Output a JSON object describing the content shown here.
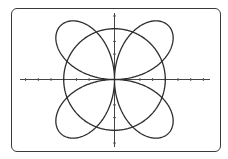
{
  "chart_data": {
    "type": "line",
    "title": "",
    "xlabel": "",
    "ylabel": "",
    "series": [
      {
        "name": "rose",
        "equation": "r = 6 sin(2θ)",
        "polar": true,
        "a": 6,
        "k": 2,
        "theta_range": [
          0,
          6.283185307
        ],
        "color": "#2e2e2e"
      },
      {
        "name": "circle",
        "equation": "r = 4",
        "polar": true,
        "r": 4,
        "theta_range": [
          0,
          6.283185307
        ],
        "color": "#2e2e2e"
      }
    ],
    "xlim": [
      -7.2,
      7.5
    ],
    "ylim": [
      -5.3,
      5.2
    ],
    "x_ticks": [
      -7,
      -6,
      -5,
      -4,
      -3,
      -2,
      -1,
      1,
      2,
      3,
      4,
      5,
      6,
      7
    ],
    "y_ticks": [
      -5,
      -4,
      -3,
      -2,
      -1,
      1,
      2,
      3,
      4,
      5
    ],
    "grid": false,
    "legend": null
  },
  "layout": {
    "origin_px": [
      114.5,
      79.5
    ],
    "unit_px": 12.7,
    "axis_color": "#444444",
    "curve_color": "#2e2e2e",
    "border_color": "#3a3a3a"
  },
  "labels": {
    "x_axis": "x-axis",
    "y_axis": "y-axis",
    "rose": "r = 6 sin(2θ)",
    "circle": "r = 4"
  }
}
